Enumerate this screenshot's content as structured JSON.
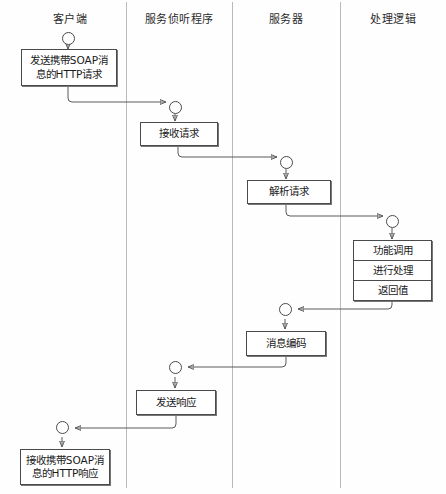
{
  "diagram": {
    "title_hidden": "",
    "lanes": [
      {
        "id": "client",
        "label": "客户端",
        "center_x": 68,
        "divider_x": 126
      },
      {
        "id": "listener",
        "label": "服务侦听程序",
        "center_x": 178,
        "divider_x": 232
      },
      {
        "id": "server",
        "label": "服务器",
        "center_x": 286,
        "divider_x": 340
      },
      {
        "id": "logic",
        "label": "处理逻辑",
        "center_x": 392,
        "divider_x": null
      }
    ],
    "nodes": [
      {
        "id": "send-request",
        "lane": "client",
        "lines": [
          "发送携带SOAP消",
          "息的HTTP请求"
        ]
      },
      {
        "id": "receive-request",
        "lane": "listener",
        "lines": [
          "接收请求"
        ]
      },
      {
        "id": "parse-request",
        "lane": "server",
        "lines": [
          "解析请求"
        ]
      },
      {
        "id": "process-stack",
        "lane": "logic",
        "rows": [
          "功能调用",
          "进行处理",
          "返回值"
        ]
      },
      {
        "id": "encode-message",
        "lane": "server",
        "lines": [
          "消息编码"
        ]
      },
      {
        "id": "send-response",
        "lane": "listener",
        "lines": [
          "发送响应"
        ]
      },
      {
        "id": "receive-response",
        "lane": "client",
        "lines": [
          "接收携带SOAP消",
          "息的HTTP响应"
        ]
      }
    ],
    "colors": {
      "node_border": "#4a4a4a",
      "connector": "#5a5a5a",
      "lane_divider": "#b9b9b9",
      "background": "#fefefe",
      "text": "#1a1a1a"
    }
  }
}
